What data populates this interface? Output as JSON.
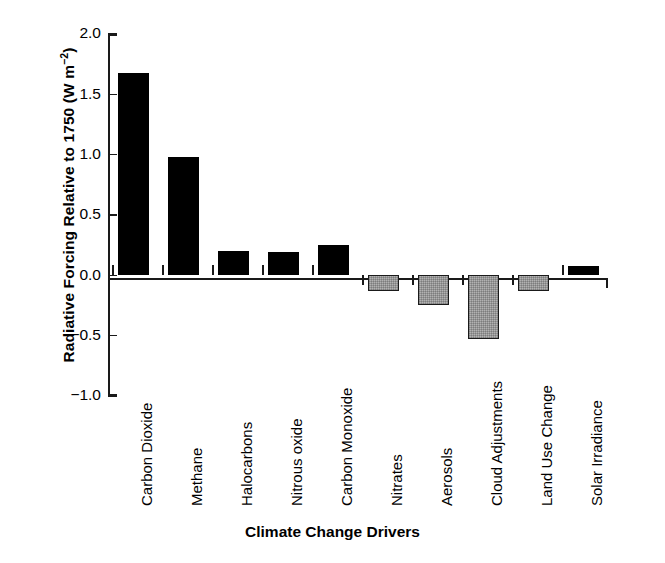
{
  "chart_data": {
    "type": "bar",
    "title": "",
    "xlabel": "Climate Change Drivers",
    "ylabel_text": "Radiative Forcing Relative to 1750 (W m",
    "ylabel_exponent": "−2",
    "ylabel_close": ")",
    "ylabel_full": "Radiative Forcing Relative to 1750 (W m−2)",
    "categories": [
      "Carbon Dioxide",
      "Methane",
      "Halocarbons",
      "Nitrous oxide",
      "Carbon Monoxide",
      "Nitrates",
      "Aerosols",
      "Cloud Adjustments",
      "Land Use Change",
      "Solar Irradiance"
    ],
    "values": [
      1.68,
      0.98,
      0.2,
      0.19,
      0.25,
      -0.13,
      -0.25,
      -0.53,
      -0.13,
      0.08
    ],
    "bar_styles": [
      "black",
      "black",
      "black",
      "black",
      "black",
      "hatched-gray",
      "hatched-gray",
      "hatched-gray",
      "hatched-gray",
      "black"
    ],
    "ylim": [
      -1.0,
      2.0
    ],
    "ytick_values": [
      2.0,
      1.5,
      1.0,
      0.5,
      0.0,
      -0.5,
      -1.0
    ],
    "ytick_labels": [
      "2.0",
      "1.5",
      "1.0",
      "0.5",
      "0.0",
      "−0.5",
      "−1.0"
    ],
    "grid": false,
    "legend": "none",
    "colors": {
      "positive_bar": "#000000",
      "negative_bar": "#b2b2b2",
      "axis": "#1a1a1a",
      "background": "#ffffff"
    }
  }
}
